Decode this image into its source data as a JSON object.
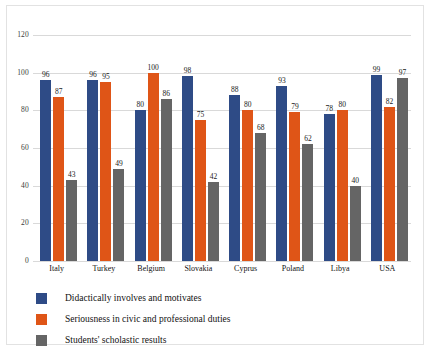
{
  "chart_data": {
    "type": "bar",
    "title": "",
    "subtitle": "",
    "xlabel": "",
    "ylabel": "",
    "ylim": [
      0,
      120
    ],
    "ytick_step": 20,
    "yticks": [
      120,
      100,
      80,
      60,
      40,
      20,
      0
    ],
    "grid": true,
    "grid_axis": "y",
    "legend_position": "bottom-left",
    "data_labels": true,
    "categories": [
      "Italy",
      "Turkey",
      "Belgium",
      "Slovakia",
      "Cyprus",
      "Poland",
      "Libya",
      "USA"
    ],
    "series": [
      {
        "name": "Didactically involves and motivates",
        "color": "#2E4B86",
        "values": [
          96,
          96,
          80,
          98,
          88,
          93,
          78,
          99
        ]
      },
      {
        "name": "Seriousness in civic and professional duties",
        "color": "#DF5517",
        "values": [
          87,
          95,
          100,
          75,
          80,
          79,
          80,
          82
        ]
      },
      {
        "name": "Students' scholastic results",
        "color": "#656565",
        "values": [
          43,
          49,
          86,
          42,
          68,
          62,
          40,
          97
        ]
      }
    ]
  },
  "colors": {
    "series_1": "#2E4B86",
    "series_2": "#DF5517",
    "series_3": "#656565",
    "gridline": "#D9D9D9",
    "frame": "#E2E2E2",
    "background": "#FFFFFF",
    "text": "#111111"
  }
}
